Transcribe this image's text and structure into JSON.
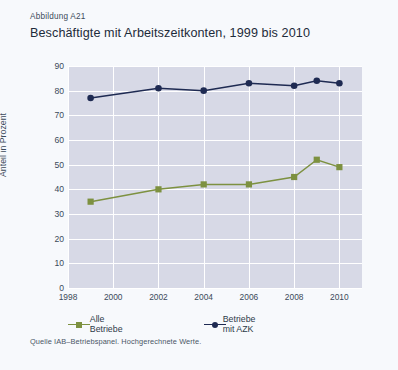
{
  "figure_number": "Abbildung A21",
  "title": "Beschäftigte mit Arbeitszeitkonten, 1999 bis 2010",
  "source_note": "Quelle IAB–Betriebspanel. Hochgerechnete Werte.",
  "colors": {
    "card_background": "#f7f9fc",
    "plot_background": "#d7d9e6",
    "grid": "#ffffff",
    "series_green": "#7d9140",
    "series_navy": "#1e2a52",
    "text": "#1d2b3a"
  },
  "legend": {
    "position": "below-axis",
    "entries": [
      {
        "label": "Alle Betriebe",
        "color": "#7d9140",
        "marker": "square"
      },
      {
        "label": "Betriebe mit AZK",
        "color": "#1e2a52",
        "marker": "circle"
      }
    ]
  },
  "chart_data": {
    "type": "line",
    "title": "Beschäftigte mit Arbeitszeitkonten, 1999 bis 2010",
    "xlabel": "",
    "ylabel": "Anteil in Prozent",
    "xlim": [
      1998,
      2011
    ],
    "ylim": [
      0,
      90
    ],
    "grid": true,
    "x_ticks": [
      1998,
      2000,
      2002,
      2004,
      2006,
      2008,
      2010
    ],
    "y_ticks": [
      0,
      10,
      20,
      30,
      40,
      50,
      60,
      70,
      80,
      90
    ],
    "x": [
      1999,
      2002,
      2004,
      2006,
      2008,
      2009,
      2010
    ],
    "series": [
      {
        "name": "Alle Betriebe",
        "color": "#7d9140",
        "marker": "square",
        "values": [
          35,
          40,
          42,
          42,
          45,
          52,
          49
        ]
      },
      {
        "name": "Betriebe mit AZK",
        "color": "#1e2a52",
        "marker": "circle",
        "values": [
          77,
          81,
          80,
          83,
          82,
          84,
          83
        ]
      }
    ]
  }
}
